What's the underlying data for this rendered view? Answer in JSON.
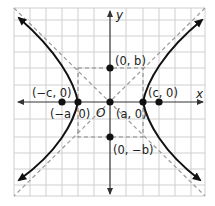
{
  "figure": {
    "type": "hyperbola-diagram",
    "axes": {
      "x_label": "x",
      "y_label": "y",
      "origin_label": "O"
    },
    "points": [
      {
        "id": "b_pos",
        "label": "(0, b)"
      },
      {
        "id": "b_neg",
        "label": "(0, −b)"
      },
      {
        "id": "c_neg",
        "label": "(−c, 0)"
      },
      {
        "id": "c_pos",
        "label": "(c, 0)"
      },
      {
        "id": "a_neg",
        "label": "(−a, 0)"
      },
      {
        "id": "a_pos",
        "label": "(a, 0)"
      }
    ],
    "colors": {
      "curve": "#111111",
      "grid": "#c8c8c8",
      "asymptote": "#9a9a9a",
      "axis": "#333333"
    }
  }
}
